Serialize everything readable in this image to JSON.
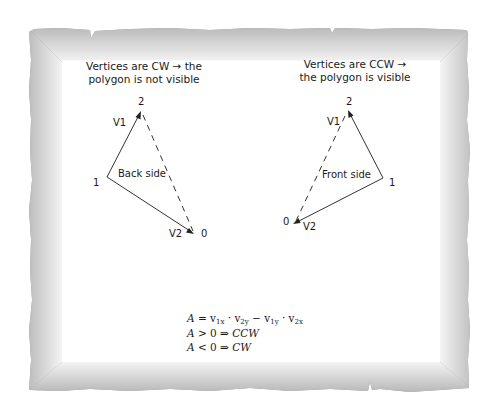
{
  "frame": {
    "style": "torn-paper border with gray gradient",
    "outer_color": "#8a8a8a",
    "inner_color": "#ffffff"
  },
  "left_panel": {
    "caption_line1": "Vertices are CW →  the",
    "caption_line2": "polygon is not visible",
    "side_label": "Back side",
    "vertex_labels": {
      "v0": "0",
      "v1": "1",
      "v2": "2"
    },
    "vector_labels": {
      "v1": "V1",
      "v2": "V2"
    }
  },
  "right_panel": {
    "caption_line1": "Vertices are CCW →",
    "caption_line2": "the polygon is visible",
    "side_label": "Front side",
    "vertex_labels": {
      "v0": "0",
      "v1": "1",
      "v2": "2"
    },
    "vector_labels": {
      "v1": "V1",
      "v2": "V2"
    }
  },
  "equations": {
    "line1": {
      "lhs": "A",
      "eq": " = v",
      "s1": "1x",
      "dot1": " · v",
      "s2": "2y",
      "minus": " − v",
      "s3": "1y",
      "dot2": " · v",
      "s4": "2x"
    },
    "line2": {
      "lhs": "A",
      "rel": " > 0 ⇒ ",
      "rhs": "CCW"
    },
    "line3": {
      "lhs": "A",
      "rel": " < 0 ⇒ ",
      "rhs": "CW"
    }
  },
  "colors": {
    "line": "#333333",
    "text": "#1a1a1a"
  }
}
